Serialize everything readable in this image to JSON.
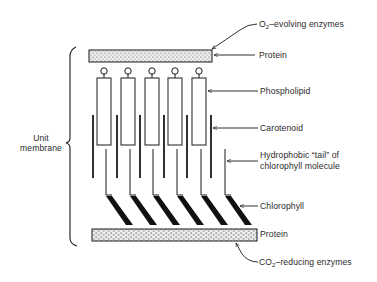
{
  "diagram": {
    "labels": {
      "o2_enzymes": {
        "prefix": "O",
        "sub": "2",
        "suffix": "–evolving enzymes"
      },
      "protein_top": "Protein",
      "phospholipid": "Phospholipid",
      "carotenoid": "Carotenoid",
      "hydrophobic_tail_line1": "Hydrophobic “tail” of",
      "hydrophobic_tail_line2": "chlorophyll molecule",
      "chlorophyll": "Chlorophyll",
      "protein_bottom": "Protein",
      "co2_enzymes": {
        "prefix": "CO",
        "sub": "2",
        "suffix": "–reducing enzymes"
      },
      "unit_membrane_line1": "Unit",
      "unit_membrane_line2": "membrane"
    },
    "components": {
      "phospholipid_count": 5,
      "carotenoid_count": 6,
      "chlorophyll_count": 6
    },
    "colors": {
      "ink": "#1a1a1a",
      "text": "#2a2a2a",
      "protein_fill": "#e6e6e6",
      "background": "#ffffff"
    }
  }
}
